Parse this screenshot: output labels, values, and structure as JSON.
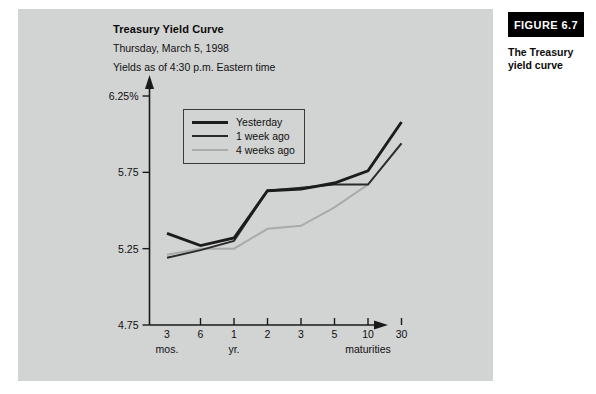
{
  "figure": {
    "number": "FIGURE 6.7",
    "caption": "The Treasury yield curve"
  },
  "chart_data": {
    "type": "line",
    "title": "Treasury Yield Curve",
    "subtitle": "Thursday, March 5, 1998",
    "note": "Yields as of 4:30 p.m. Eastern time",
    "xlabel": "maturities",
    "ylabel": "",
    "ylim": [
      4.75,
      6.25
    ],
    "yticks": [
      "4.75",
      "5.25",
      "5.75",
      "6.25%"
    ],
    "ytick_values": [
      4.75,
      5.25,
      5.75,
      6.25
    ],
    "grid": false,
    "legend_position": "upper-left-inside",
    "categories": [
      "3",
      "6",
      "1",
      "2",
      "3",
      "5",
      "10",
      "30"
    ],
    "category_groups": [
      {
        "label": "mos.",
        "at": "3"
      },
      {
        "label": "yr.",
        "at": "1"
      },
      {
        "label": "maturities",
        "at": "10"
      }
    ],
    "series": [
      {
        "name": "Yesterday",
        "color": "#1c1c1c",
        "values": [
          5.35,
          5.27,
          5.32,
          5.63,
          5.64,
          5.68,
          5.76,
          6.08
        ]
      },
      {
        "name": "1 week ago",
        "color": "#2a2a2a",
        "values": [
          5.19,
          5.24,
          5.3,
          5.63,
          5.65,
          5.67,
          5.67,
          5.94
        ]
      },
      {
        "name": "4 weeks ago",
        "color": "#a9abab",
        "values": [
          5.21,
          5.25,
          5.25,
          5.38,
          5.4,
          5.52,
          5.67,
          5.94
        ]
      }
    ]
  }
}
